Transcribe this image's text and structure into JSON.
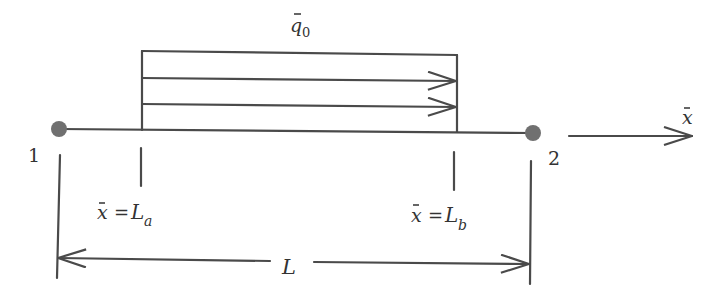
{
  "diagram": {
    "type": "beam-element-with-distributed-axial-load",
    "load_label": {
      "symbol": "q",
      "bar": true,
      "subscript": "0"
    },
    "nodes": [
      {
        "id": "1",
        "label": "1"
      },
      {
        "id": "2",
        "label": "2"
      }
    ],
    "axis_label": {
      "symbol": "x",
      "bar": true
    },
    "start_marker": {
      "lhs": "x",
      "eq": "=",
      "rhs": "L",
      "subscript": "a"
    },
    "end_marker": {
      "lhs": "x",
      "eq": "=",
      "rhs": "L",
      "subscript": "b"
    },
    "length_label": "L",
    "colors": {
      "line": "#4a4a4a",
      "node": "#707070",
      "text": "#333333"
    }
  }
}
